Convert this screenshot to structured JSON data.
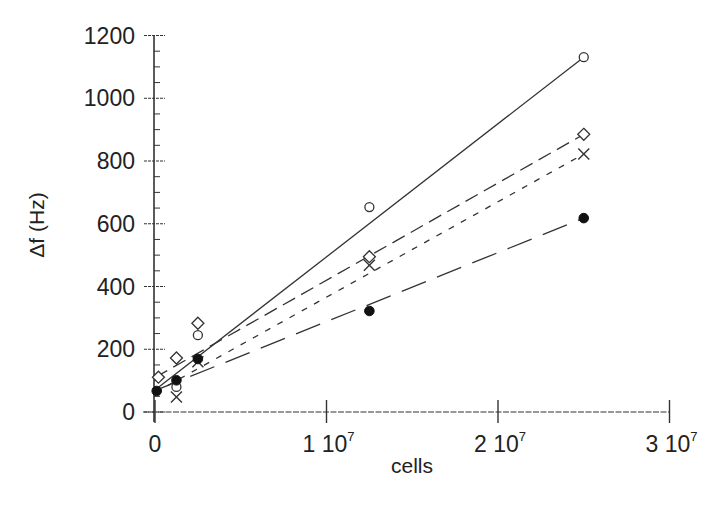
{
  "chart_data": {
    "type": "scatter",
    "title": "",
    "xlabel": "cells",
    "ylabel": "Δf (Hz)",
    "xlim": [
      0,
      30000000
    ],
    "ylim": [
      0,
      1200
    ],
    "grid": false,
    "legend": "none",
    "x_ticks": [
      {
        "value": 0,
        "label": "0",
        "sup": ""
      },
      {
        "value": 10000000,
        "label": "1 10",
        "sup": "7"
      },
      {
        "value": 20000000,
        "label": "2 10",
        "sup": "7"
      },
      {
        "value": 30000000,
        "label": "3 10",
        "sup": "7"
      }
    ],
    "y_ticks": [
      0,
      200,
      400,
      600,
      800,
      1000,
      1200
    ],
    "y_minor_step": 50,
    "series": [
      {
        "name": "open-circle",
        "marker": "circle-open",
        "line": "solid",
        "x": [
          1250000,
          2500000,
          12500000,
          25000000
        ],
        "values": [
          80,
          245,
          653,
          1131
        ],
        "fit": {
          "x0": 0,
          "y0": 70,
          "x1": 25000000,
          "y1": 1131
        }
      },
      {
        "name": "open-diamond",
        "marker": "diamond-open",
        "line": "medium-dash",
        "x": [
          200000,
          1250000,
          2500000,
          12500000,
          25000000
        ],
        "values": [
          111,
          172,
          283,
          495,
          885
        ],
        "fit": {
          "x0": 0,
          "y0": 110,
          "x1": 25000000,
          "y1": 885
        }
      },
      {
        "name": "cross",
        "marker": "x",
        "line": "short-dash",
        "x": [
          1250000,
          2500000,
          12500000,
          25000000
        ],
        "values": [
          48,
          160,
          468,
          822
        ],
        "fit": {
          "x0": 0,
          "y0": 62,
          "x1": 25000000,
          "y1": 822
        }
      },
      {
        "name": "filled-circle",
        "marker": "circle-filled",
        "line": "long-dash",
        "x": [
          100000,
          1250000,
          2500000,
          12500000,
          25000000
        ],
        "values": [
          67,
          101,
          169,
          322,
          618
        ],
        "fit": {
          "x0": 0,
          "y0": 68,
          "x1": 25000000,
          "y1": 618
        }
      }
    ]
  }
}
